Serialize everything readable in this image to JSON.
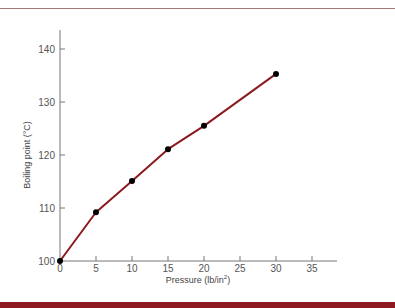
{
  "chart_data": {
    "type": "line",
    "title": "",
    "xlabel": "Pressure (lb/in²)",
    "xlabel_base": "Pressure (lb/in",
    "xlabel_sup": "2",
    "xlabel_end": ")",
    "ylabel": "Boiling point (°C)",
    "xlim": [
      0,
      37
    ],
    "ylim": [
      100,
      142
    ],
    "x_ticks": [
      0,
      5,
      10,
      15,
      20,
      25,
      30,
      35
    ],
    "y_ticks": [
      100,
      110,
      120,
      130,
      140
    ],
    "grid": false,
    "legend": null,
    "series": [
      {
        "name": "Boiling point vs pressure",
        "color": "#8b1a1f",
        "marker_color": "#000000",
        "x": [
          0,
          5,
          10,
          15,
          20,
          30
        ],
        "values": [
          100,
          109.2,
          115.1,
          121.1,
          125.5,
          135.3
        ]
      }
    ]
  },
  "colors": {
    "top_rule": "#a8777b",
    "bottom_band": "#8e1b22",
    "line": "#8b1a1f",
    "axis": "#777777"
  }
}
